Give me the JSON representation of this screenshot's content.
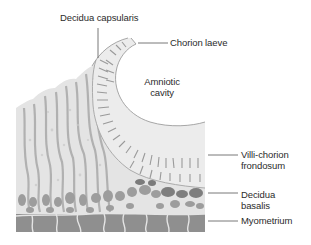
{
  "figure": {
    "type": "anatomical cross-section",
    "colors": {
      "background": "#ffffff",
      "tissue_light": "#e6e6e6",
      "tissue_mid": "#bdbdbd",
      "tissue_dark": "#8c8c8c",
      "myometrium": "#8f8f8f",
      "leader_line": "#555555",
      "text": "#2b2b2b"
    }
  },
  "labels": {
    "decidua_capsularis": "Decidua capsularis",
    "chorion_laeve": "Chorion laeve",
    "amniotic_cavity_line1": "Amniotic",
    "amniotic_cavity_line2": "cavity",
    "villi_chorion_line1": "Villi-chorion",
    "villi_chorion_line2": "frondosum",
    "decidua_basalis_line1": "Decidua",
    "decidua_basalis_line2": "basalis",
    "myometrium": "Myometrium"
  }
}
